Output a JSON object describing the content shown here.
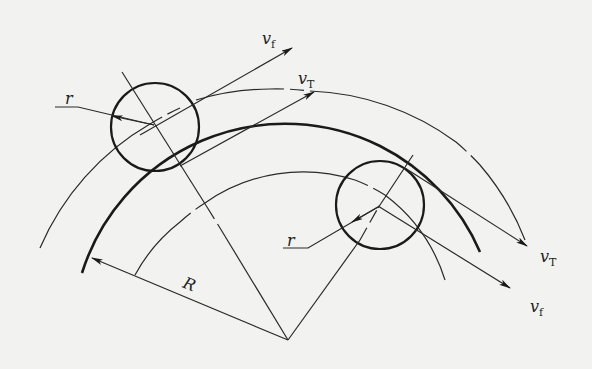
{
  "diagram": {
    "type": "geometry-diagram",
    "labels": {
      "vf_top": {
        "main": "v",
        "sub": "f"
      },
      "vT_top": {
        "main": "v",
        "sub": "T"
      },
      "r_left": "r",
      "r_right": "r",
      "R": "R",
      "vT_right": {
        "main": "v",
        "sub": "T"
      },
      "vf_right": {
        "main": "v",
        "sub": "f"
      }
    },
    "geometry": {
      "center": [
        288,
        340
      ],
      "workpiece_radius_label": "R",
      "tool_radius_label": "r",
      "left_tool_circle": {
        "cx": 155,
        "cy": 127,
        "r": 44
      },
      "right_tool_circle": {
        "cx": 380,
        "cy": 205,
        "r": 44
      }
    },
    "colors": {
      "background": "#f2f2f0",
      "ink": "#1a1a1a"
    }
  }
}
